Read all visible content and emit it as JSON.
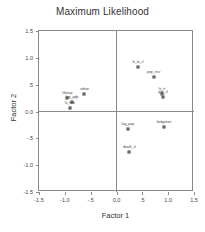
{
  "chart_data": {
    "type": "scatter",
    "title": "Maximum Likelihood",
    "xlabel": "Factor 1",
    "ylabel": "Factor 2",
    "xlim": [
      -1.5,
      1.5
    ],
    "ylim": [
      -1.5,
      1.5
    ],
    "grid": false,
    "legend": null,
    "xticks": [
      "-1.5",
      "-1.0",
      "-.5",
      "0.0",
      ".5",
      "1.0",
      "1.5"
    ],
    "xtickvalues": [
      -1.5,
      -1.0,
      -0.5,
      0.0,
      0.5,
      1.0,
      1.5
    ],
    "yticks": [
      "1.5",
      "1.0",
      ".5",
      "0.0",
      "-.5",
      "-1.0",
      "-1.5"
    ],
    "ytickvalues": [
      1.5,
      1.0,
      0.5,
      0.0,
      -0.5,
      -1.0,
      -1.5
    ],
    "origin_lines": true,
    "points": [
      {
        "label": "b_to_rl",
        "x": 0.42,
        "y": 0.82
      },
      {
        "label": "pop_incr",
        "x": 0.72,
        "y": 0.65
      },
      {
        "label": "lit_rt",
        "x": 0.88,
        "y": 0.33
      },
      {
        "label": "gdp_rl",
        "x": 0.9,
        "y": 0.27
      },
      {
        "label": "urban",
        "x": -0.62,
        "y": 0.33
      },
      {
        "label": "lifeexp",
        "x": -0.95,
        "y": 0.26
      },
      {
        "label": "log_gdp",
        "x": -0.86,
        "y": 0.18
      },
      {
        "label": "lit_fem",
        "x": -0.9,
        "y": 0.07
      },
      {
        "label": "log_pop",
        "x": 0.22,
        "y": -0.33
      },
      {
        "label": "babymort",
        "x": 0.92,
        "y": -0.28
      },
      {
        "label": "death_rt",
        "x": 0.25,
        "y": -0.75
      }
    ]
  }
}
